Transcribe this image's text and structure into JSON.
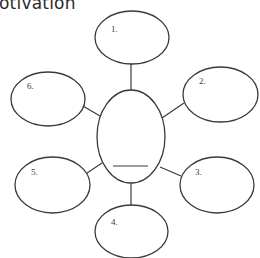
{
  "title": "otivation",
  "diagram": {
    "type": "spider-web organizer",
    "stroke_color": "#3a3a3a",
    "center": {
      "cx": 131,
      "cy": 136.5,
      "rx": 34,
      "ry": 46.5,
      "blank_line": {
        "x1": 113,
        "y1": 166,
        "x2": 148,
        "y2": 166
      },
      "label": ""
    },
    "nodes": [
      {
        "id": 1,
        "label": "1.",
        "cx": 132,
        "cy": 37.5,
        "rx": 37,
        "ry": 26.5,
        "label_x": 111,
        "label_y": 32
      },
      {
        "id": 2,
        "label": "2.",
        "cx": 220.5,
        "cy": 94.5,
        "rx": 37.5,
        "ry": 27.5,
        "label_x": 199,
        "label_y": 84
      },
      {
        "id": 3,
        "label": "3.",
        "cx": 217,
        "cy": 185,
        "rx": 37,
        "ry": 28,
        "label_x": 195,
        "label_y": 175
      },
      {
        "id": 4,
        "label": "4.",
        "cx": 131.5,
        "cy": 231.5,
        "rx": 36.5,
        "ry": 26.5,
        "label_x": 111,
        "label_y": 225
      },
      {
        "id": 5,
        "label": "5.",
        "cx": 52.5,
        "cy": 185,
        "rx": 37.5,
        "ry": 28,
        "label_x": 31,
        "label_y": 175
      },
      {
        "id": 6,
        "label": "6.",
        "cx": 48,
        "cy": 99,
        "rx": 37,
        "ry": 27,
        "label_x": 27,
        "label_y": 89
      }
    ],
    "connectors": [
      {
        "to": 1,
        "x1": 131,
        "y1": 64,
        "x2": 131,
        "y2": 90
      },
      {
        "to": 2,
        "x1": 162,
        "y1": 118,
        "x2": 184,
        "y2": 103
      },
      {
        "to": 3,
        "x1": 160,
        "y1": 167,
        "x2": 181,
        "y2": 176
      },
      {
        "to": 4,
        "x1": 131,
        "y1": 183,
        "x2": 131,
        "y2": 205
      },
      {
        "to": 5,
        "x1": 102,
        "y1": 163,
        "x2": 87,
        "y2": 173
      },
      {
        "to": 6,
        "x1": 100,
        "y1": 116,
        "x2": 83,
        "y2": 106
      }
    ]
  }
}
